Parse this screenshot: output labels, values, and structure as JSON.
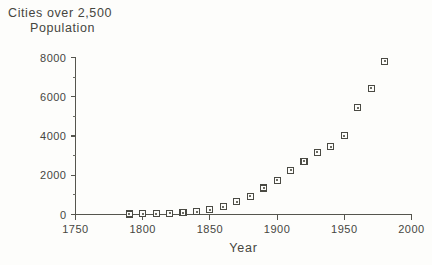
{
  "chart_data": {
    "type": "scatter",
    "title": "Cities over 2,500 Population",
    "title_line1": "Cities over 2,500",
    "title_line2": "Population",
    "xlabel": "Year",
    "ylabel": "",
    "xlim": [
      1750,
      2000
    ],
    "ylim": [
      0,
      8000
    ],
    "xticks": [
      1750,
      1800,
      1850,
      1900,
      1950,
      2000
    ],
    "xtick_labels": [
      "1750",
      "1800",
      "1850",
      "1900",
      "1950",
      "2000"
    ],
    "yticks": [
      0,
      2000,
      4000,
      6000,
      8000
    ],
    "ytick_labels": [
      "0",
      "2000",
      "4000",
      "6000",
      "8000"
    ],
    "yticks_minor": [
      1000,
      3000,
      5000,
      7000
    ],
    "grid": false,
    "legend": null,
    "marker": "open-square",
    "x": [
      1790,
      1800,
      1810,
      1820,
      1830,
      1840,
      1850,
      1860,
      1870,
      1880,
      1890,
      1900,
      1910,
      1920,
      1930,
      1940,
      1950,
      1960,
      1970,
      1980
    ],
    "y": [
      24,
      33,
      46,
      61,
      90,
      131,
      236,
      392,
      663,
      939,
      1348,
      1737,
      2262,
      2722,
      3165,
      3464,
      4023,
      5445,
      6435,
      7800
    ],
    "series": [
      {
        "name": "Cities over 2,500 Population",
        "points": [
          {
            "year": 1790,
            "value": 24
          },
          {
            "year": 1800,
            "value": 33
          },
          {
            "year": 1810,
            "value": 46
          },
          {
            "year": 1820,
            "value": 61
          },
          {
            "year": 1830,
            "value": 90
          },
          {
            "year": 1840,
            "value": 131
          },
          {
            "year": 1850,
            "value": 236
          },
          {
            "year": 1860,
            "value": 392
          },
          {
            "year": 1870,
            "value": 663
          },
          {
            "year": 1880,
            "value": 939
          },
          {
            "year": 1890,
            "value": 1348
          },
          {
            "year": 1900,
            "value": 1737
          },
          {
            "year": 1910,
            "value": 2262
          },
          {
            "year": 1920,
            "value": 2722
          },
          {
            "year": 1930,
            "value": 3165
          },
          {
            "year": 1940,
            "value": 3464
          },
          {
            "year": 1950,
            "value": 4023
          },
          {
            "year": 1960,
            "value": 5445
          },
          {
            "year": 1970,
            "value": 6435
          },
          {
            "year": 1980,
            "value": 7800
          }
        ]
      }
    ],
    "colors": {
      "background": "#fdfdfb",
      "axis": "#55554e",
      "marker_edge": "#4a4a43",
      "marker_face": "#fdfdfb",
      "marker_center": "#6d6d64",
      "text": "#46463f"
    }
  }
}
